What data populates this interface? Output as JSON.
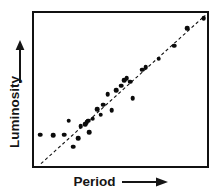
{
  "figure": {
    "background_color": "#ffffff",
    "frame_color": "#111111",
    "point_color": "#0b0b0b",
    "trendline_color": "#111111"
  },
  "axes": {
    "y": {
      "label": "Luminosity",
      "arrow_icon": "up-arrow-icon",
      "direction": "increasing upward"
    },
    "x": {
      "label": "Period",
      "arrow_icon": "right-arrow-icon",
      "direction": "increasing rightward"
    }
  },
  "chart_data": {
    "type": "scatter",
    "title": "",
    "subtitle": "",
    "xlabel": "Period",
    "ylabel": "Luminosity",
    "xlim": [
      0,
      100
    ],
    "ylim": [
      0,
      100
    ],
    "grid": false,
    "legend": null,
    "tick_labels": {
      "x": [],
      "y": []
    },
    "annotations": [],
    "series": [
      {
        "name": "Cepheid variables",
        "marker": "filled-circle",
        "color": "#0b0b0b",
        "points": [
          {
            "x": 3.5,
            "y": 20.5
          },
          {
            "x": 11.0,
            "y": 20.0
          },
          {
            "x": 17.5,
            "y": 20.5
          },
          {
            "x": 20.0,
            "y": 29.5
          },
          {
            "x": 22.5,
            "y": 12.5
          },
          {
            "x": 25.5,
            "y": 18.0
          },
          {
            "x": 27.0,
            "y": 26.0
          },
          {
            "x": 29.5,
            "y": 27.5
          },
          {
            "x": 30.5,
            "y": 28.5
          },
          {
            "x": 31.5,
            "y": 29.5
          },
          {
            "x": 32.0,
            "y": 22.0
          },
          {
            "x": 34.0,
            "y": 31.0
          },
          {
            "x": 36.5,
            "y": 37.0
          },
          {
            "x": 38.5,
            "y": 33.5
          },
          {
            "x": 40.0,
            "y": 40.0
          },
          {
            "x": 42.5,
            "y": 47.0
          },
          {
            "x": 45.0,
            "y": 36.5
          },
          {
            "x": 47.5,
            "y": 49.5
          },
          {
            "x": 50.5,
            "y": 52.5
          },
          {
            "x": 52.0,
            "y": 56.0
          },
          {
            "x": 53.5,
            "y": 57.5
          },
          {
            "x": 55.5,
            "y": 55.0
          },
          {
            "x": 57.0,
            "y": 44.5
          },
          {
            "x": 62.5,
            "y": 63.0
          },
          {
            "x": 64.5,
            "y": 64.5
          },
          {
            "x": 72.0,
            "y": 70.0
          },
          {
            "x": 81.0,
            "y": 78.5
          },
          {
            "x": 88.5,
            "y": 90.0
          },
          {
            "x": 98.0,
            "y": 96.5
          }
        ]
      }
    ],
    "trendline": {
      "name": "fitted period-luminosity relation",
      "style": "dashed",
      "color": "#111111",
      "x_start": 4.0,
      "y_start": 1.5,
      "x_end": 99.0,
      "y_end": 98.5
    }
  }
}
